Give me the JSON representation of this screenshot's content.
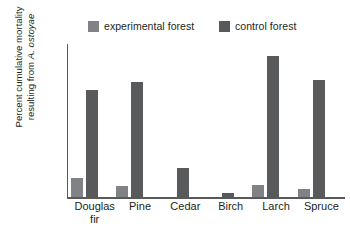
{
  "chart_data": {
    "type": "bar",
    "title": "",
    "xlabel": "",
    "ylabel": "Percent cumulative mortality resulting from A. ostoyae",
    "ylabel_lines": [
      "Percent cumulative mortality",
      "resulting from ",
      "A. ostoyae"
    ],
    "ylim": [
      0,
      30
    ],
    "yticks": [
      0,
      5,
      10,
      15,
      20,
      25,
      30
    ],
    "ytick_labels": [
      "0",
      "5",
      "10",
      "15",
      "20",
      "25",
      "30"
    ],
    "grid": false,
    "legend_position": "top",
    "categories": [
      "Douglas fir",
      "Pine",
      "Cedar",
      "Birch",
      "Larch",
      "Spruce"
    ],
    "category_label_lines": [
      [
        "Douglas",
        "fir"
      ],
      [
        "Pine",
        ""
      ],
      [
        "Cedar",
        ""
      ],
      [
        "Birch",
        ""
      ],
      [
        "Larch",
        ""
      ],
      [
        "Spruce",
        ""
      ]
    ],
    "series": [
      {
        "name": "experimental forest",
        "color": "#808285",
        "values": [
          3.8,
          2.2,
          0,
          0,
          2.4,
          1.6
        ]
      },
      {
        "name": "control forest",
        "color": "#58595b",
        "values": [
          21.0,
          22.5,
          5.7,
          0.8,
          27.7,
          23.0
        ]
      }
    ]
  },
  "legend": {
    "entries": [
      {
        "label": "experimental forest",
        "color": "#808285"
      },
      {
        "label": "control forest",
        "color": "#58595b"
      }
    ]
  },
  "colors": {
    "experimental": "#808285",
    "control": "#58595b",
    "axis": "#58595b",
    "text": "#231f20",
    "background": "#ffffff"
  }
}
